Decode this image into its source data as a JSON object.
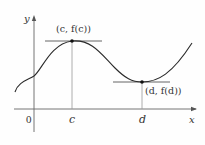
{
  "figure": {
    "axes": {
      "x_label": "x",
      "y_label": "y",
      "origin_label": "0"
    },
    "points": [
      {
        "name": "local-max",
        "label": "(c, f(c))",
        "x_tick": "c"
      },
      {
        "name": "local-min",
        "label": "(d, f(d))",
        "x_tick": "d"
      }
    ],
    "colors": {
      "curve": "#2a2a2a",
      "axes": "#555555",
      "tangent": "#555555",
      "vertical_guides": "#9a9a9a",
      "text": "#333333"
    }
  }
}
